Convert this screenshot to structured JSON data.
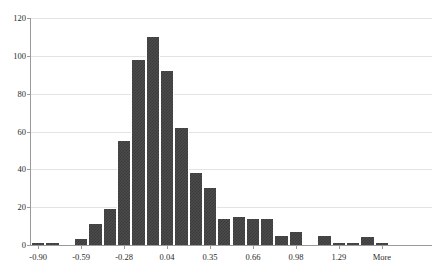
{
  "chart_data": {
    "type": "bar",
    "title": "",
    "subtitle": "",
    "xlabel": "",
    "ylabel": "",
    "grid": true,
    "legend": false,
    "ylim": [
      0,
      120
    ],
    "ytick_labels": [
      "0",
      "20",
      "40",
      "60",
      "80",
      "100",
      "120"
    ],
    "ytick_values": [
      0,
      20,
      40,
      60,
      80,
      100,
      120
    ],
    "xtick_labels": [
      "-0.90",
      "-0.59",
      "-0.28",
      "0.04",
      "0.35",
      "0.66",
      "0.98",
      "1.29",
      "More"
    ],
    "xtick_bin_index": [
      0,
      3,
      6,
      9,
      12,
      15,
      18,
      21,
      24
    ],
    "bar_color": "#4b4b4b",
    "gridline_color": "#e3e3e3",
    "axis_color": "#9a9a9a",
    "background_color": "#ffffff",
    "categories": [
      "-0.90",
      "-0.80",
      "-0.69",
      "-0.59",
      "-0.49",
      "-0.38",
      "-0.28",
      "-0.18",
      "-0.07",
      "0.04",
      "0.14",
      "0.24",
      "0.35",
      "0.45",
      "0.56",
      "0.66",
      "0.76",
      "0.87",
      "0.98",
      "1.08",
      "1.18",
      "1.29",
      "1.39",
      "1.50",
      "More",
      "",
      "",
      ""
    ],
    "values": [
      1,
      1,
      0,
      3,
      11,
      19,
      55,
      98,
      110,
      92,
      62,
      38,
      30,
      14,
      15,
      14,
      14,
      5,
      7,
      0,
      5,
      1,
      1,
      4,
      1,
      0,
      0,
      0
    ]
  }
}
